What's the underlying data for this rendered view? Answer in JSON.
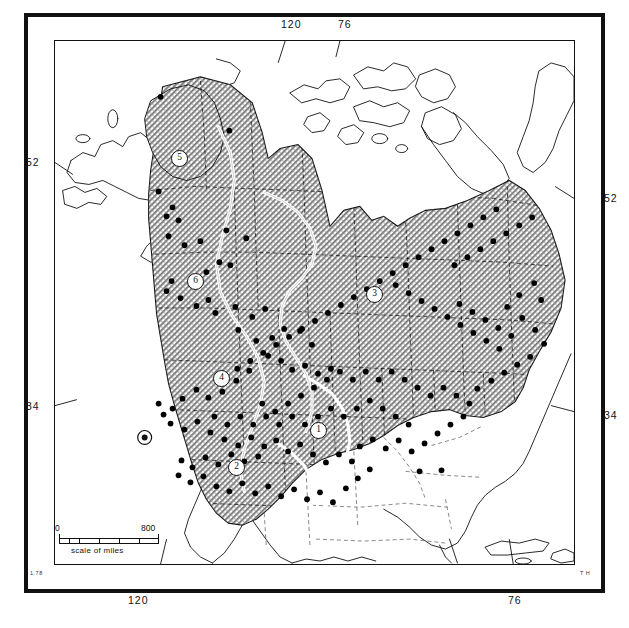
{
  "figure": {
    "kind": "distribution-map",
    "credit": "T H",
    "corner_left_mark": "1.78"
  },
  "graticule": {
    "top": [
      {
        "label": "120",
        "x_pct": 45.0
      },
      {
        "label": "76",
        "x_pct": 56.0
      }
    ],
    "bottom": [
      {
        "label": "120",
        "x_pct": 16.5
      },
      {
        "label": "76",
        "x_pct": 89.5
      }
    ],
    "left": [
      {
        "label": "52",
        "y_pct": 23.0
      },
      {
        "label": "34",
        "y_pct": 69.5
      }
    ],
    "right": [
      {
        "label": "52",
        "y_pct": 29.5
      },
      {
        "label": "34",
        "y_pct": 71.0
      }
    ]
  },
  "scale": {
    "min_label": "0",
    "max_label": "800",
    "caption": "scale of miles",
    "units": "miles",
    "segments": 5
  },
  "regions": [
    {
      "id": "1",
      "label": "1",
      "x": 318,
      "y": 430
    },
    {
      "id": "2",
      "label": "2",
      "x": 236,
      "y": 467
    },
    {
      "id": "3",
      "label": "3",
      "x": 374,
      "y": 293
    },
    {
      "id": "4",
      "label": "4",
      "x": 221,
      "y": 378
    },
    {
      "id": "5",
      "label": "5",
      "x": 179,
      "y": 158
    },
    {
      "id": "6",
      "label": "6",
      "x": 195,
      "y": 281
    }
  ],
  "colors": {
    "ink": "#111111",
    "shading": "#a9a9a9",
    "paper": "#ffffff",
    "region_divider": "#ffffff",
    "point": "#000000"
  },
  "chart_data": {
    "type": "map",
    "title": "",
    "projection": "north-america-conic",
    "shaded_area_meaning": "distribution / range extent (hatched)",
    "point_meaning": "collection locality record",
    "region_count": 6,
    "collection_points": [
      [
        160,
        96
      ],
      [
        229,
        130
      ],
      [
        158,
        191
      ],
      [
        172,
        207
      ],
      [
        166,
        216
      ],
      [
        178,
        220
      ],
      [
        168,
        236
      ],
      [
        184,
        245
      ],
      [
        200,
        241
      ],
      [
        226,
        230
      ],
      [
        246,
        238
      ],
      [
        230,
        265
      ],
      [
        219,
        262
      ],
      [
        206,
        272
      ],
      [
        171,
        281
      ],
      [
        166,
        291
      ],
      [
        180,
        298
      ],
      [
        196,
        306
      ],
      [
        208,
        300
      ],
      [
        215,
        313
      ],
      [
        235,
        307
      ],
      [
        252,
        317
      ],
      [
        265,
        309
      ],
      [
        238,
        330
      ],
      [
        256,
        341
      ],
      [
        272,
        338
      ],
      [
        284,
        329
      ],
      [
        300,
        331
      ],
      [
        312,
        345
      ],
      [
        268,
        356
      ],
      [
        281,
        361
      ],
      [
        292,
        370
      ],
      [
        305,
        366
      ],
      [
        318,
        374
      ],
      [
        331,
        369
      ],
      [
        249,
        371
      ],
      [
        236,
        381
      ],
      [
        222,
        392
      ],
      [
        208,
        398
      ],
      [
        196,
        390
      ],
      [
        182,
        399
      ],
      [
        172,
        409
      ],
      [
        163,
        415
      ],
      [
        158,
        404
      ],
      [
        170,
        424
      ],
      [
        184,
        430
      ],
      [
        197,
        422
      ],
      [
        210,
        433
      ],
      [
        224,
        440
      ],
      [
        238,
        446
      ],
      [
        251,
        438
      ],
      [
        264,
        447
      ],
      [
        276,
        441
      ],
      [
        288,
        452
      ],
      [
        300,
        445
      ],
      [
        258,
        457
      ],
      [
        244,
        462
      ],
      [
        231,
        455
      ],
      [
        218,
        465
      ],
      [
        205,
        458
      ],
      [
        192,
        468
      ],
      [
        181,
        461
      ],
      [
        178,
        476
      ],
      [
        190,
        483
      ],
      [
        203,
        477
      ],
      [
        216,
        487
      ],
      [
        229,
        492
      ],
      [
        242,
        484
      ],
      [
        255,
        494
      ],
      [
        268,
        487
      ],
      [
        281,
        497
      ],
      [
        294,
        490
      ],
      [
        307,
        500
      ],
      [
        320,
        493
      ],
      [
        333,
        503
      ],
      [
        346,
        489
      ],
      [
        358,
        479
      ],
      [
        370,
        470
      ],
      [
        352,
        462
      ],
      [
        339,
        455
      ],
      [
        326,
        463
      ],
      [
        313,
        455
      ],
      [
        360,
        447
      ],
      [
        373,
        440
      ],
      [
        386,
        449
      ],
      [
        399,
        441
      ],
      [
        412,
        452
      ],
      [
        425,
        444
      ],
      [
        438,
        434
      ],
      [
        451,
        425
      ],
      [
        464,
        417
      ],
      [
        470,
        404
      ],
      [
        457,
        396
      ],
      [
        444,
        388
      ],
      [
        431,
        396
      ],
      [
        418,
        388
      ],
      [
        405,
        380
      ],
      [
        392,
        372
      ],
      [
        379,
        380
      ],
      [
        366,
        372
      ],
      [
        353,
        380
      ],
      [
        340,
        372
      ],
      [
        327,
        380
      ],
      [
        314,
        388
      ],
      [
        301,
        396
      ],
      [
        288,
        404
      ],
      [
        275,
        412
      ],
      [
        262,
        404
      ],
      [
        420,
        472
      ],
      [
        442,
        471
      ],
      [
        409,
        425
      ],
      [
        396,
        417
      ],
      [
        383,
        409
      ],
      [
        370,
        401
      ],
      [
        357,
        409
      ],
      [
        344,
        417
      ],
      [
        331,
        409
      ],
      [
        318,
        417
      ],
      [
        305,
        425
      ],
      [
        292,
        417
      ],
      [
        279,
        425
      ],
      [
        266,
        417
      ],
      [
        253,
        425
      ],
      [
        240,
        417
      ],
      [
        227,
        425
      ],
      [
        214,
        417
      ],
      [
        478,
        389
      ],
      [
        492,
        381
      ],
      [
        505,
        373
      ],
      [
        518,
        365
      ],
      [
        531,
        357
      ],
      [
        500,
        349
      ],
      [
        487,
        341
      ],
      [
        474,
        333
      ],
      [
        461,
        325
      ],
      [
        448,
        317
      ],
      [
        435,
        309
      ],
      [
        422,
        301
      ],
      [
        409,
        293
      ],
      [
        396,
        285
      ],
      [
        455,
        265
      ],
      [
        468,
        257
      ],
      [
        481,
        249
      ],
      [
        494,
        241
      ],
      [
        507,
        233
      ],
      [
        520,
        225
      ],
      [
        533,
        217
      ],
      [
        497,
        209
      ],
      [
        484,
        217
      ],
      [
        471,
        225
      ],
      [
        458,
        233
      ],
      [
        445,
        241
      ],
      [
        432,
        249
      ],
      [
        419,
        257
      ],
      [
        406,
        265
      ],
      [
        393,
        273
      ],
      [
        380,
        281
      ],
      [
        367,
        289
      ],
      [
        354,
        297
      ],
      [
        341,
        305
      ],
      [
        328,
        313
      ],
      [
        315,
        321
      ],
      [
        302,
        329
      ],
      [
        289,
        337
      ],
      [
        276,
        345
      ],
      [
        263,
        353
      ],
      [
        250,
        361
      ],
      [
        237,
        369
      ],
      [
        535,
        283
      ],
      [
        542,
        300
      ],
      [
        520,
        295
      ],
      [
        508,
        307
      ],
      [
        523,
        318
      ],
      [
        536,
        330
      ],
      [
        545,
        344
      ],
      [
        512,
        336
      ],
      [
        499,
        328
      ],
      [
        486,
        320
      ],
      [
        473,
        312
      ],
      [
        460,
        304
      ]
    ]
  }
}
